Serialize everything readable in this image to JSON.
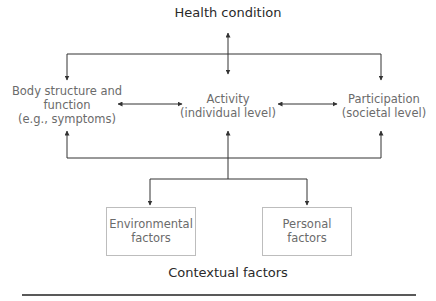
{
  "diagram": {
    "title": "Health condition",
    "nodes": {
      "body": {
        "line1": "Body structure and",
        "line2": "function",
        "line3": "(e.g., symptoms)"
      },
      "activity": {
        "line1": "Activity",
        "line2": "(individual level)"
      },
      "participation": {
        "line1": "Participation",
        "line2": "(societal level)"
      },
      "environmental": {
        "line1": "Environmental",
        "line2": "factors"
      },
      "personal": {
        "line1": "Personal",
        "line2": "factors"
      }
    },
    "footer": "Contextual factors"
  }
}
